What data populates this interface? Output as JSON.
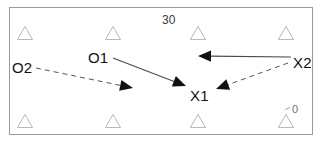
{
  "diagram": {
    "frame": {
      "x": 9,
      "y": 7,
      "width": 304,
      "height": 128,
      "border_color": "#9a9a9a"
    },
    "background_color": "#ffffff",
    "ink_color": "#111111",
    "marker_color": "#9b9b9b"
  },
  "yard_markers": [
    {
      "name": "yard-30",
      "text": "30",
      "x": 162,
      "y": 14,
      "style": "normal"
    },
    {
      "name": "yard-0",
      "text": "0",
      "x": 292,
      "y": 104,
      "style": "faint"
    }
  ],
  "tick_marks": [
    {
      "name": "hash-tick",
      "x": 285,
      "y": 108
    }
  ],
  "defenders": [
    {
      "name": "defender-triangle-1",
      "x": 25,
      "y": 33,
      "size": 13
    },
    {
      "name": "defender-triangle-2",
      "x": 113,
      "y": 33,
      "size": 13
    },
    {
      "name": "defender-triangle-3",
      "x": 198,
      "y": 33,
      "size": 13
    },
    {
      "name": "defender-triangle-4",
      "x": 286,
      "y": 33,
      "size": 13
    },
    {
      "name": "defender-triangle-5",
      "x": 25,
      "y": 121,
      "size": 13
    },
    {
      "name": "defender-triangle-6",
      "x": 113,
      "y": 121,
      "size": 13
    },
    {
      "name": "defender-triangle-7",
      "x": 198,
      "y": 121,
      "size": 13
    },
    {
      "name": "defender-triangle-8",
      "x": 286,
      "y": 121,
      "size": 13
    }
  ],
  "players": [
    {
      "name": "player-label-o2",
      "label": "O2",
      "x": 12,
      "y": 60
    },
    {
      "name": "player-label-o1",
      "label": "O1",
      "x": 88,
      "y": 50
    },
    {
      "name": "player-label-x1",
      "label": "X1",
      "x": 190,
      "y": 88
    },
    {
      "name": "player-label-x2",
      "label": "X2",
      "x": 293,
      "y": 55
    }
  ],
  "routes": [
    {
      "name": "route-o2-run",
      "from": "O2",
      "to": "midfield",
      "style": "dashed",
      "x1": 36,
      "y1": 68,
      "x2": 133,
      "y2": 88,
      "head_angle": 12
    },
    {
      "name": "route-o1-to-x1",
      "from": "O1",
      "to": "X1",
      "style": "solid",
      "x1": 113,
      "y1": 58,
      "x2": 186,
      "y2": 86,
      "head_angle": 21
    },
    {
      "name": "route-x2-sweep-left",
      "from": "X2",
      "to": "midfield-upper",
      "style": "solid",
      "x1": 291,
      "y1": 57,
      "x2": 198,
      "y2": 56,
      "head_angle": 180
    },
    {
      "name": "route-x2-to-x1",
      "from": "X2",
      "to": "X1",
      "style": "dashed",
      "x1": 288,
      "y1": 63,
      "x2": 216,
      "y2": 89,
      "head_angle": 200
    }
  ]
}
